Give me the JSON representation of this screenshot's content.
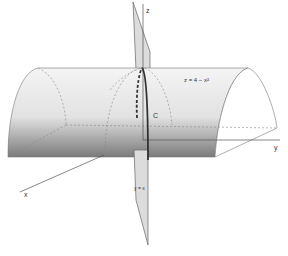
{
  "diagram": {
    "labels": {
      "z_axis": "z",
      "y_axis": "y",
      "x_axis": "x",
      "surface": "z = 4 − x²",
      "curve": "C",
      "plane": "y = x"
    },
    "colors": {
      "surface_light": "#ececec",
      "surface_dark": "#7a7a7a",
      "plane": "#d8d8d8",
      "line": "#555555",
      "curve": "#333333"
    }
  }
}
